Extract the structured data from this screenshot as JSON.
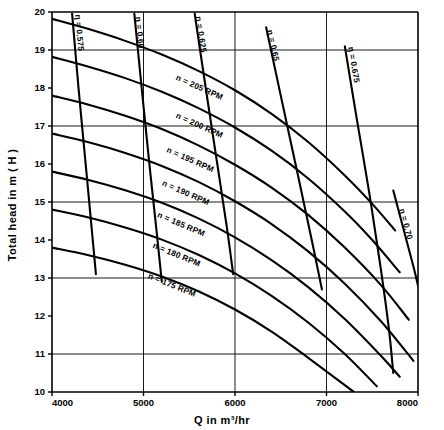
{
  "chart_data": {
    "type": "line",
    "title": "",
    "xlabel": "Q in m³/hr",
    "ylabel": "Total head in m ( H )",
    "xlim": [
      4000,
      8000
    ],
    "ylim": [
      10,
      20
    ],
    "xticks": [
      "4000",
      "5000",
      "6000",
      "7000",
      "8000"
    ],
    "xtick_values": [
      4000,
      5000,
      6000,
      7000,
      8000
    ],
    "yticks": [
      "10",
      "11",
      "12",
      "13",
      "14",
      "15",
      "16",
      "17",
      "18",
      "19",
      "20"
    ],
    "ytick_values": [
      10,
      11,
      12,
      13,
      14,
      15,
      16,
      17,
      18,
      19,
      20
    ],
    "grid": true,
    "grid_x_values": [
      5000,
      6000,
      7000
    ],
    "grid_y_values": [
      11,
      13,
      15,
      17,
      19
    ],
    "legend": "none",
    "series": [
      {
        "name": "n = 205 RPM",
        "label": "n = 205 RPM",
        "label_q": 5600,
        "label_h": 17.95,
        "points": [
          [
            4000,
            19.82
          ],
          [
            4400,
            19.55
          ],
          [
            4800,
            19.24
          ],
          [
            5200,
            18.88
          ],
          [
            5600,
            18.45
          ],
          [
            6000,
            17.94
          ],
          [
            6400,
            17.32
          ],
          [
            6800,
            16.58
          ],
          [
            7200,
            15.7
          ],
          [
            7500,
            14.95
          ],
          [
            7750,
            14.25
          ]
        ]
      },
      {
        "name": "n = 200 RPM",
        "label": "n = 200 RPM",
        "label_q": 5600,
        "label_h": 16.95,
        "points": [
          [
            4000,
            18.82
          ],
          [
            4400,
            18.56
          ],
          [
            4800,
            18.26
          ],
          [
            5200,
            17.9
          ],
          [
            5600,
            17.47
          ],
          [
            6000,
            16.96
          ],
          [
            6400,
            16.35
          ],
          [
            6800,
            15.62
          ],
          [
            7200,
            14.75
          ],
          [
            7500,
            14.0
          ],
          [
            7800,
            13.15
          ]
        ]
      },
      {
        "name": "n = 195 RPM",
        "label": "n = 195 RPM",
        "label_q": 5500,
        "label_h": 16.05,
        "points": [
          [
            4000,
            17.8
          ],
          [
            4400,
            17.56
          ],
          [
            4800,
            17.27
          ],
          [
            5200,
            16.92
          ],
          [
            5600,
            16.49
          ],
          [
            6000,
            15.98
          ],
          [
            6400,
            15.38
          ],
          [
            6800,
            14.66
          ],
          [
            7200,
            13.8
          ],
          [
            7600,
            12.8
          ],
          [
            7900,
            11.9
          ]
        ]
      },
      {
        "name": "n = 190 RPM",
        "label": "n = 190 RPM",
        "label_q": 5450,
        "label_h": 15.18,
        "points": [
          [
            4000,
            16.8
          ],
          [
            4400,
            16.57
          ],
          [
            4800,
            16.29
          ],
          [
            5200,
            15.95
          ],
          [
            5600,
            15.53
          ],
          [
            6000,
            15.02
          ],
          [
            6400,
            14.42
          ],
          [
            6800,
            13.7
          ],
          [
            7200,
            12.85
          ],
          [
            7600,
            11.85
          ],
          [
            7950,
            10.82
          ]
        ]
      },
      {
        "name": "n = 185 RPM",
        "label": "n = 185 RPM",
        "label_q": 5400,
        "label_h": 14.35,
        "points": [
          [
            4000,
            15.8
          ],
          [
            4400,
            15.58
          ],
          [
            4800,
            15.31
          ],
          [
            5200,
            14.98
          ],
          [
            5600,
            14.57
          ],
          [
            6000,
            14.07
          ],
          [
            6400,
            13.47
          ],
          [
            6800,
            12.76
          ],
          [
            7200,
            11.92
          ],
          [
            7600,
            10.94
          ],
          [
            7800,
            10.4
          ]
        ]
      },
      {
        "name": "n = 180 RPM",
        "label": "n = 180 RPM",
        "label_q": 5350,
        "label_h": 13.55,
        "points": [
          [
            4000,
            14.8
          ],
          [
            4400,
            14.59
          ],
          [
            4800,
            14.33
          ],
          [
            5200,
            14.01
          ],
          [
            5600,
            13.61
          ],
          [
            6000,
            13.12
          ],
          [
            6400,
            12.53
          ],
          [
            6800,
            11.83
          ],
          [
            7200,
            11.0
          ],
          [
            7550,
            10.15
          ]
        ]
      },
      {
        "name": "n = 175 RPM",
        "label": "n = 175 RPM",
        "label_q": 5300,
        "label_h": 12.75,
        "points": [
          [
            4000,
            13.8
          ],
          [
            4400,
            13.6
          ],
          [
            4800,
            13.35
          ],
          [
            5200,
            13.04
          ],
          [
            5600,
            12.65
          ],
          [
            6000,
            12.17
          ],
          [
            6400,
            11.59
          ],
          [
            6800,
            10.9
          ],
          [
            7300,
            10.0
          ]
        ]
      }
    ],
    "efficiency_curves": [
      {
        "name": "eta-0.575",
        "label": "η = 0.575",
        "value": 0.575,
        "label_q": 4270,
        "label_h": 19.45,
        "points": [
          [
            4220,
            19.95
          ],
          [
            4290,
            18.0
          ],
          [
            4360,
            16.2
          ],
          [
            4430,
            14.4
          ],
          [
            4480,
            13.1
          ]
        ]
      },
      {
        "name": "eta-0.60",
        "label": "η = 0.60",
        "value": 0.6,
        "label_q": 4930,
        "label_h": 19.45,
        "points": [
          [
            4900,
            19.95
          ],
          [
            4980,
            18.0
          ],
          [
            5060,
            16.1
          ],
          [
            5140,
            14.3
          ],
          [
            5200,
            12.9
          ]
        ]
      },
      {
        "name": "eta-0.625",
        "label": "η = 0.625",
        "value": 0.625,
        "label_q": 5600,
        "label_h": 19.4,
        "points": [
          [
            5560,
            19.95
          ],
          [
            5680,
            18.0
          ],
          [
            5800,
            16.1
          ],
          [
            5910,
            14.35
          ],
          [
            5980,
            13.1
          ]
        ]
      },
      {
        "name": "eta-0.65",
        "label": "η = 0.65",
        "value": 0.65,
        "label_q": 6390,
        "label_h": 19.1,
        "points": [
          [
            6340,
            19.6
          ],
          [
            6500,
            17.8
          ],
          [
            6670,
            15.9
          ],
          [
            6830,
            14.1
          ],
          [
            6950,
            12.7
          ]
        ]
      },
      {
        "name": "eta-0.675",
        "label": "η = 0.675",
        "value": 0.675,
        "label_q": 7270,
        "label_h": 18.6,
        "points": [
          [
            7200,
            19.1
          ],
          [
            7330,
            17.2
          ],
          [
            7470,
            15.2
          ],
          [
            7590,
            13.3
          ],
          [
            7680,
            11.7
          ],
          [
            7730,
            10.5
          ]
        ]
      },
      {
        "name": "eta-0.70",
        "label": "η = 0.70",
        "value": 0.7,
        "label_q": 7840,
        "label_h": 14.4,
        "points": [
          [
            7730,
            15.3
          ],
          [
            7840,
            14.3
          ],
          [
            7950,
            13.3
          ],
          [
            8000,
            12.8
          ]
        ]
      }
    ]
  },
  "axes": {
    "x_title": "Q in m³/hr",
    "y_title": "Total head in m ( H )"
  }
}
